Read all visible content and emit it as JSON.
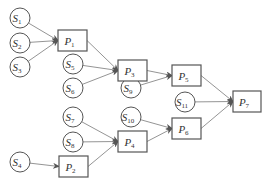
{
  "diagram": {
    "type": "directed-graph",
    "source_nodes": [
      {
        "id": "S1",
        "letter": "S",
        "sub": "1",
        "cx": 20,
        "cy": 18
      },
      {
        "id": "S2",
        "letter": "S",
        "sub": "2",
        "cx": 20,
        "cy": 43
      },
      {
        "id": "S3",
        "letter": "S",
        "sub": "3",
        "cx": 20,
        "cy": 67
      },
      {
        "id": "S4",
        "letter": "S",
        "sub": "4",
        "cx": 20,
        "cy": 162
      },
      {
        "id": "S5",
        "letter": "S",
        "sub": "5",
        "cx": 73,
        "cy": 64
      },
      {
        "id": "S6",
        "letter": "S",
        "sub": "6",
        "cx": 73,
        "cy": 88
      },
      {
        "id": "S7",
        "letter": "S",
        "sub": "7",
        "cx": 73,
        "cy": 117
      },
      {
        "id": "S8",
        "letter": "S",
        "sub": "8",
        "cx": 73,
        "cy": 142
      },
      {
        "id": "S9",
        "letter": "S",
        "sub": "9",
        "cx": 131,
        "cy": 88
      },
      {
        "id": "S10",
        "letter": "S",
        "sub": "10",
        "cx": 131,
        "cy": 117
      },
      {
        "id": "S11",
        "letter": "S",
        "sub": "11",
        "cx": 185,
        "cy": 102
      }
    ],
    "process_nodes": [
      {
        "id": "P1",
        "letter": "P",
        "sub": "1",
        "x": 58,
        "y": 30,
        "w": 29,
        "h": 21
      },
      {
        "id": "P2",
        "letter": "P",
        "sub": "2",
        "x": 59,
        "y": 156,
        "w": 29,
        "h": 21
      },
      {
        "id": "P3",
        "letter": "P",
        "sub": "3",
        "x": 118,
        "y": 60,
        "w": 29,
        "h": 21
      },
      {
        "id": "P4",
        "letter": "P",
        "sub": "4",
        "x": 118,
        "y": 131,
        "w": 29,
        "h": 21
      },
      {
        "id": "P5",
        "letter": "P",
        "sub": "5",
        "x": 172,
        "y": 65,
        "w": 29,
        "h": 21
      },
      {
        "id": "P6",
        "letter": "P",
        "sub": "6",
        "x": 172,
        "y": 118,
        "w": 29,
        "h": 21
      },
      {
        "id": "P7",
        "letter": "P",
        "sub": "7",
        "x": 233,
        "y": 91,
        "w": 28,
        "h": 21
      }
    ],
    "edges": [
      [
        "S1",
        "P1"
      ],
      [
        "S2",
        "P1"
      ],
      [
        "S3",
        "P1"
      ],
      [
        "P1",
        "P3"
      ],
      [
        "S5",
        "P3"
      ],
      [
        "S6",
        "P3"
      ],
      [
        "P3",
        "P5"
      ],
      [
        "S9",
        "P5"
      ],
      [
        "S4",
        "P2"
      ],
      [
        "S7",
        "P4"
      ],
      [
        "S8",
        "P4"
      ],
      [
        "P2",
        "P4"
      ],
      [
        "S10",
        "P6"
      ],
      [
        "P4",
        "P6"
      ],
      [
        "P5",
        "P7"
      ],
      [
        "S11",
        "P7"
      ],
      [
        "P6",
        "P7"
      ]
    ]
  }
}
